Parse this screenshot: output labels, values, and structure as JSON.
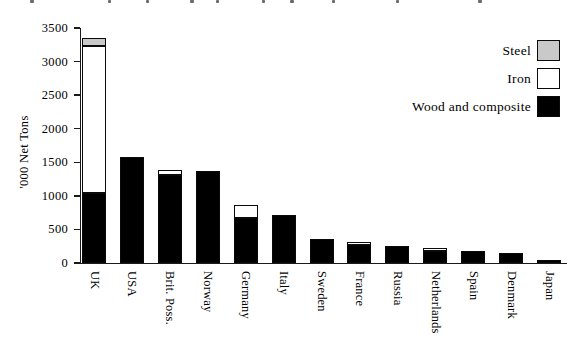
{
  "figure": {
    "y_axis_title": "'000 Net Tons",
    "cropped_caption_note": "top line of caption cut off at image edge",
    "caption_fragment_xs": [
      30,
      108,
      146,
      190,
      216,
      262,
      290,
      332,
      396,
      478
    ]
  },
  "chart_data": {
    "type": "bar",
    "stacked": true,
    "title": "",
    "xlabel": "",
    "ylabel": "'000 Net Tons",
    "ylim": [
      0,
      3500
    ],
    "ytick_interval": 500,
    "grid": false,
    "legend_position": "top-right",
    "categories": [
      "UK",
      "USA",
      "Brit. Poss.",
      "Norway",
      "Germany",
      "Italy",
      "Sweden",
      "France",
      "Russia",
      "Netherlands",
      "Spain",
      "Denmark",
      "Japan"
    ],
    "series": [
      {
        "name": "Wood and composite",
        "color": "#000000",
        "values": [
          1040,
          1580,
          1310,
          1370,
          665,
          720,
          360,
          265,
          250,
          175,
          180,
          145,
          45
        ]
      },
      {
        "name": "Iron",
        "color": "#ffffff",
        "values": [
          2190,
          0,
          70,
          0,
          205,
          0,
          0,
          45,
          0,
          45,
          0,
          0,
          0
        ]
      },
      {
        "name": "Steel",
        "color": "#c9c9c9",
        "values": [
          120,
          0,
          0,
          0,
          0,
          0,
          0,
          0,
          0,
          0,
          0,
          0,
          0
        ]
      }
    ],
    "legend": [
      {
        "label": "Steel",
        "color": "#c9c9c9"
      },
      {
        "label": "Iron",
        "color": "#ffffff"
      },
      {
        "label": "Wood and composite",
        "color": "#000000"
      }
    ]
  }
}
